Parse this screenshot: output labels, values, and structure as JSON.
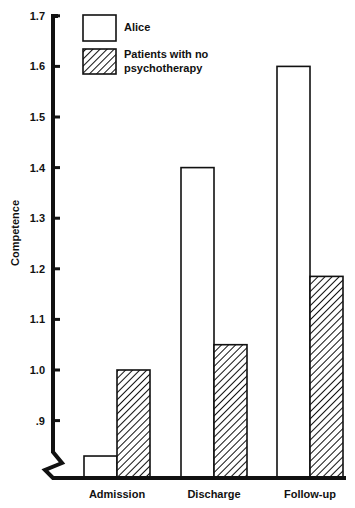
{
  "chart_data": {
    "type": "bar",
    "title": "",
    "xlabel": "",
    "ylabel": "Competence",
    "ylim": [
      0.8,
      1.7
    ],
    "yticks": [
      0.9,
      1.0,
      1.1,
      1.2,
      1.3,
      1.4,
      1.5,
      1.6,
      1.7
    ],
    "ytick_labels": [
      ".9",
      "1.0",
      "1.1",
      "1.2",
      "1.3",
      "1.4",
      "1.5",
      "1.6",
      "1.7"
    ],
    "axis_break": true,
    "grid": false,
    "legend_position": "top-left-inside",
    "categories": [
      "Admission",
      "Discharge",
      "Follow-up"
    ],
    "series": [
      {
        "name": "Alice",
        "pattern": "open",
        "values": [
          0.83,
          1.4,
          1.6
        ]
      },
      {
        "name": "Patients with no psychotherapy",
        "pattern": "hatched",
        "values": [
          1.0,
          1.05,
          1.185
        ]
      }
    ]
  },
  "legend": {
    "alice_label": "Alice",
    "patients_label_line1": "Patients with no",
    "patients_label_line2": "psychotherapy"
  },
  "colors": {
    "ink": "#111111",
    "background": "#ffffff"
  }
}
